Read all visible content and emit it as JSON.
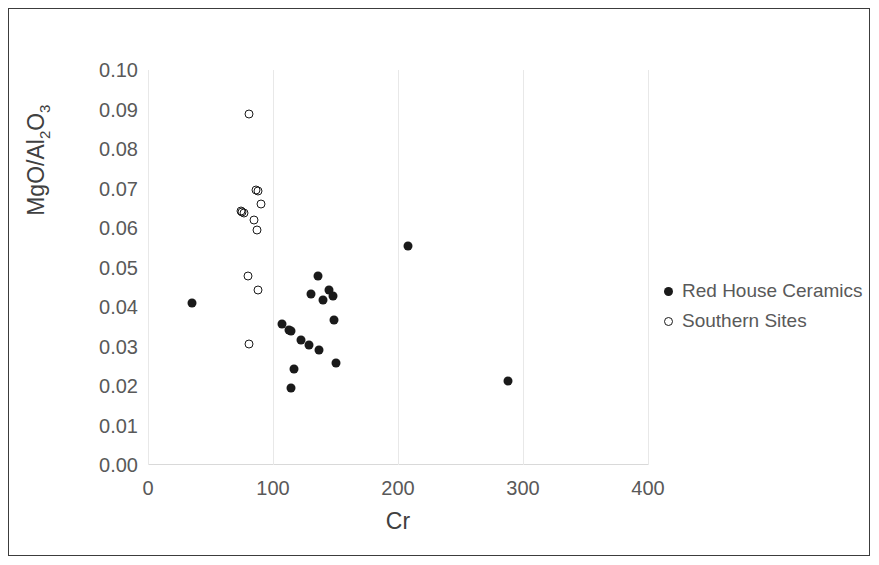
{
  "chart_data": {
    "type": "scatter",
    "title": "",
    "xlabel": "Cr",
    "ylabel": "MgO/Al2O3",
    "ylabel_parts": {
      "prefix": "MgO/Al",
      "sub1": "2",
      "mid": "O",
      "sub2": "3"
    },
    "xlim": [
      0,
      400
    ],
    "ylim": [
      0.0,
      0.1
    ],
    "xticks": [
      0,
      100,
      200,
      300,
      400
    ],
    "xtick_labels": [
      "0",
      "100",
      "200",
      "300",
      "400"
    ],
    "yticks": [
      0.0,
      0.01,
      0.02,
      0.03,
      0.04,
      0.05,
      0.06,
      0.07,
      0.08,
      0.09,
      0.1
    ],
    "ytick_labels": [
      "0.00",
      "0.01",
      "0.02",
      "0.03",
      "0.04",
      "0.05",
      "0.06",
      "0.07",
      "0.08",
      "0.09",
      "0.10"
    ],
    "grid": "vertical-only",
    "legend_position": "right",
    "marker_color": "#1a1a1a",
    "series": [
      {
        "name": "Red House Ceramics",
        "marker": "filled-circle",
        "points": [
          [
            35,
            0.041
          ],
          [
            107,
            0.0358
          ],
          [
            113,
            0.0341
          ],
          [
            114,
            0.0338
          ],
          [
            117,
            0.0243
          ],
          [
            114,
            0.0194
          ],
          [
            122,
            0.0317
          ],
          [
            129,
            0.0303
          ],
          [
            130,
            0.0432
          ],
          [
            136,
            0.0479
          ],
          [
            140,
            0.0418
          ],
          [
            137,
            0.029
          ],
          [
            145,
            0.0443
          ],
          [
            148,
            0.0429
          ],
          [
            149,
            0.0367
          ],
          [
            150,
            0.0259
          ],
          [
            208,
            0.0554
          ],
          [
            288,
            0.0212
          ]
        ]
      },
      {
        "name": "Southern Sites",
        "marker": "open-circle",
        "points": [
          [
            81,
            0.0889
          ],
          [
            74,
            0.0644
          ],
          [
            75,
            0.0641
          ],
          [
            77,
            0.0639
          ],
          [
            86,
            0.0697
          ],
          [
            88,
            0.0694
          ],
          [
            90,
            0.0661
          ],
          [
            85,
            0.062
          ],
          [
            87,
            0.0594
          ],
          [
            80,
            0.0478
          ],
          [
            88,
            0.0443
          ],
          [
            81,
            0.0307
          ]
        ]
      }
    ]
  },
  "legend": {
    "items": [
      {
        "label": "Red House Ceramics",
        "marker": "filled-circle"
      },
      {
        "label": "Southern Sites",
        "marker": "open-circle"
      }
    ]
  }
}
